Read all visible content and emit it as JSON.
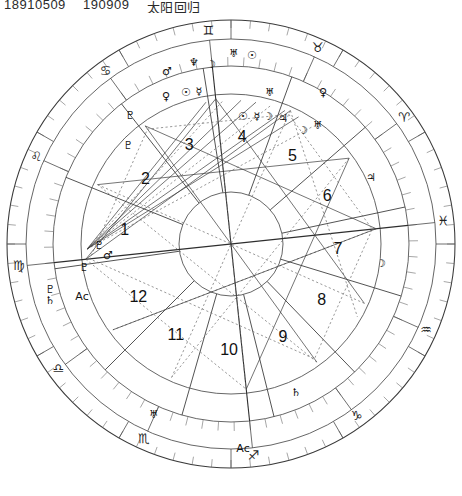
{
  "header": {
    "date_code": "18910509",
    "time_code": "190909",
    "label_cn": "太阳回归"
  },
  "chart": {
    "type": "astrological-natal-wheel",
    "center": {
      "x": 231,
      "y": 244
    },
    "radii": {
      "outer_ring": 224,
      "degree_ring_inner": 205,
      "sign_ring_inner": 178,
      "house_ring_inner": 150,
      "inner_circle": 52
    },
    "rotation_note": "Ascendant on left, Gemini at top, signs counterclockwise",
    "asc_angle_deg": 186,
    "signs": [
      {
        "name": "Gemini",
        "glyph": "♊",
        "order": 1,
        "angle": 96
      },
      {
        "name": "Taurus",
        "glyph": "♉",
        "order": 2,
        "angle": 66
      },
      {
        "name": "Aries",
        "glyph": "♈",
        "order": 3,
        "angle": 36
      },
      {
        "name": "Pisces",
        "glyph": "♓",
        "order": 4,
        "angle": 6
      },
      {
        "name": "Aquarius",
        "glyph": "♒",
        "order": 5,
        "angle": -24
      },
      {
        "name": "Capricorn",
        "glyph": "♑",
        "order": 6,
        "angle": -54
      },
      {
        "name": "Sagittarius",
        "glyph": "♐",
        "order": 7,
        "angle": -84
      },
      {
        "name": "Scorpio",
        "glyph": "♏",
        "order": 8,
        "angle": -114
      },
      {
        "name": "Libra",
        "glyph": "♎",
        "order": 9,
        "angle": -144
      },
      {
        "name": "Virgo",
        "glyph": "♍",
        "order": 10,
        "angle": 186
      },
      {
        "name": "Leo",
        "glyph": "♌",
        "order": 11,
        "angle": 156
      },
      {
        "name": "Cancer",
        "glyph": "♋",
        "order": 12,
        "angle": 126
      }
    ],
    "houses": [
      {
        "number": "1",
        "angle": 173
      },
      {
        "number": "2",
        "angle": 143
      },
      {
        "number": "3",
        "angle": 113
      },
      {
        "number": "4",
        "angle": 84
      },
      {
        "number": "5",
        "angle": 55
      },
      {
        "number": "6",
        "angle": 26
      },
      {
        "number": "7",
        "angle": -3
      },
      {
        "number": "8",
        "angle": -32
      },
      {
        "number": "9",
        "angle": -61
      },
      {
        "number": "10",
        "angle": -91
      },
      {
        "number": "11",
        "angle": -121
      },
      {
        "number": "12",
        "angle": -150
      }
    ],
    "planets": [
      {
        "name": "Mars",
        "glyph": "♂",
        "x": 167,
        "y": 72
      },
      {
        "name": "Neptune",
        "glyph": "♆",
        "x": 194,
        "y": 63
      },
      {
        "name": "Moon",
        "glyph": "☽",
        "x": 211,
        "y": 65
      },
      {
        "name": "Uranus",
        "glyph": "♅",
        "x": 234,
        "y": 54
      },
      {
        "name": "Sun",
        "glyph": "☉",
        "x": 252,
        "y": 56
      },
      {
        "name": "Venus",
        "glyph": "♀",
        "x": 166,
        "y": 97
      },
      {
        "name": "Sun",
        "glyph": "☉",
        "x": 186,
        "y": 93
      },
      {
        "name": "Mercury",
        "glyph": "☿",
        "x": 199,
        "y": 92
      },
      {
        "name": "Venus",
        "glyph": "♀",
        "x": 323,
        "y": 93
      },
      {
        "name": "Uranus",
        "glyph": "♅",
        "x": 270,
        "y": 93
      },
      {
        "name": "Sun",
        "glyph": "☉",
        "x": 243,
        "y": 117
      },
      {
        "name": "Mercury",
        "glyph": "☿",
        "x": 257,
        "y": 117
      },
      {
        "name": "Moon",
        "glyph": "☽",
        "x": 268,
        "y": 117
      },
      {
        "name": "Jupiter",
        "glyph": "♃",
        "x": 283,
        "y": 119
      },
      {
        "name": "Moon",
        "glyph": "☽",
        "x": 303,
        "y": 131
      },
      {
        "name": "Uranus",
        "glyph": "♅",
        "x": 318,
        "y": 126
      },
      {
        "name": "Pluto",
        "glyph": "♇",
        "x": 130,
        "y": 116
      },
      {
        "name": "Pluto",
        "glyph": "♇",
        "x": 128,
        "y": 146
      },
      {
        "name": "Jupiter",
        "glyph": "♃",
        "x": 371,
        "y": 178
      },
      {
        "name": "Moon",
        "glyph": "☽",
        "x": 381,
        "y": 264
      },
      {
        "name": "Pluto",
        "glyph": "♇",
        "x": 99,
        "y": 246
      },
      {
        "name": "Mars",
        "glyph": "♂",
        "x": 108,
        "y": 256
      },
      {
        "name": "Pluto",
        "glyph": "♇",
        "x": 84,
        "y": 268
      },
      {
        "name": "Pluto",
        "glyph": "♇",
        "x": 50,
        "y": 290
      },
      {
        "name": "Saturn",
        "glyph": "♄",
        "x": 50,
        "y": 301
      },
      {
        "name": "Ascendant",
        "glyph": "Aᴄ",
        "x": 82,
        "y": 297
      },
      {
        "name": "Uranus",
        "glyph": "♅",
        "x": 154,
        "y": 415
      },
      {
        "name": "Saturn",
        "glyph": "♄",
        "x": 296,
        "y": 393
      },
      {
        "name": "Ascendant",
        "glyph": "Aᴄ",
        "x": 243,
        "y": 449
      }
    ]
  }
}
